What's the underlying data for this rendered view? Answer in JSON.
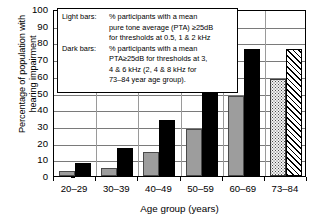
{
  "chart_data": {
    "type": "bar",
    "title": "",
    "xlabel": "Age group (years)",
    "ylabel": "Percentage of population with hearing impairment",
    "ylim": [
      0,
      100
    ],
    "ytick_step": 10,
    "grid": true,
    "legend_position": "inside-top-left",
    "categories": [
      "20–29",
      "30–39",
      "40–49",
      "50–59",
      "60–69",
      "73–84"
    ],
    "yticks": [
      "100",
      "90",
      "80",
      "70",
      "60",
      "50",
      "40",
      "30",
      "20",
      "10",
      "0"
    ],
    "series": [
      {
        "name": "Light bars",
        "color": "#9d9d9d",
        "values": [
          3,
          5,
          14.5,
          28,
          48,
          58
        ],
        "pattern_last": "dotted"
      },
      {
        "name": "Dark bars",
        "color": "#000000",
        "values": [
          8,
          16.5,
          33.5,
          52,
          76,
          76
        ],
        "pattern_last": "hatched"
      }
    ]
  },
  "legend": {
    "light_key": "Light bars:",
    "light_lines": [
      "% participants with a mean",
      "pure tone average (PTA) ≥25dB",
      "for thresholds at 0.5, 1 & 2 kHz"
    ],
    "dark_key": "Dark bars:",
    "dark_lines": [
      "% participants with a mean",
      "PTA≥25dB for thresholds at 3,",
      "4 & 6 kHz (2, 4 & 8 kHz for",
      "73–84 year  age group)."
    ]
  },
  "axes": {
    "x_title": "Age group (years)",
    "y_title_line1": "Percentage of population with",
    "y_title_line2": "hearing impairment"
  }
}
